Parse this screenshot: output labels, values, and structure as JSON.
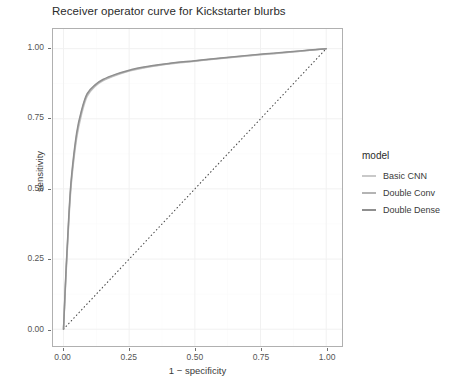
{
  "chart_data": {
    "type": "line",
    "title": "Receiver operator curve for Kickstarter blurbs",
    "xlabel": "1 − specificity",
    "ylabel": "sensitivity",
    "xlim": [
      -0.04,
      1.06
    ],
    "ylim": [
      -0.06,
      1.07
    ],
    "xticks": [
      "0.00",
      "0.25",
      "0.50",
      "0.75",
      "1.00"
    ],
    "xtick_values": [
      0.0,
      0.25,
      0.5,
      0.75,
      1.0
    ],
    "yticks": [
      "0.00",
      "0.25",
      "0.50",
      "0.75",
      "1.00"
    ],
    "ytick_values": [
      0.0,
      0.25,
      0.5,
      0.75,
      1.0
    ],
    "grid": true,
    "legend_position": "right",
    "legend_title": "model",
    "reference_line": {
      "name": "chance diagonal",
      "style": "dotted",
      "color": "#4d4d4d",
      "x": [
        0.0,
        1.0
      ],
      "y": [
        0.0,
        1.0
      ]
    },
    "series": [
      {
        "name": "Basic CNN",
        "color": "#c9c9c9",
        "x": [
          0.0,
          0.01,
          0.02,
          0.03,
          0.05,
          0.07,
          0.09,
          0.12,
          0.15,
          0.2,
          0.25,
          0.3,
          0.4,
          0.5,
          0.6,
          0.7,
          0.8,
          0.9,
          1.0
        ],
        "y": [
          0.0,
          0.2,
          0.38,
          0.52,
          0.68,
          0.77,
          0.83,
          0.865,
          0.885,
          0.905,
          0.92,
          0.93,
          0.945,
          0.955,
          0.965,
          0.974,
          0.982,
          0.991,
          1.0
        ]
      },
      {
        "name": "Double Conv",
        "color": "#b4b4b4",
        "x": [
          0.0,
          0.01,
          0.02,
          0.03,
          0.05,
          0.07,
          0.09,
          0.12,
          0.15,
          0.2,
          0.25,
          0.3,
          0.4,
          0.5,
          0.6,
          0.7,
          0.8,
          0.9,
          1.0
        ],
        "y": [
          0.0,
          0.21,
          0.39,
          0.53,
          0.69,
          0.78,
          0.835,
          0.868,
          0.888,
          0.907,
          0.921,
          0.932,
          0.946,
          0.956,
          0.966,
          0.975,
          0.983,
          0.991,
          1.0
        ]
      },
      {
        "name": "Double Dense",
        "color": "#8f8f8f",
        "x": [
          0.0,
          0.01,
          0.02,
          0.03,
          0.05,
          0.07,
          0.09,
          0.12,
          0.15,
          0.2,
          0.25,
          0.3,
          0.4,
          0.5,
          0.6,
          0.7,
          0.8,
          0.9,
          1.0
        ],
        "y": [
          0.0,
          0.22,
          0.4,
          0.54,
          0.7,
          0.785,
          0.84,
          0.871,
          0.89,
          0.909,
          0.923,
          0.934,
          0.947,
          0.957,
          0.967,
          0.976,
          0.984,
          0.992,
          1.0
        ]
      }
    ]
  },
  "legend": {
    "title": "model",
    "items": [
      {
        "label": "Basic CNN",
        "color": "#c9c9c9"
      },
      {
        "label": "Double Conv",
        "color": "#b4b4b4"
      },
      {
        "label": "Double Dense",
        "color": "#8f8f8f"
      }
    ]
  },
  "axes": {
    "x_label": "1 − specificity",
    "y_label": "sensitivity"
  },
  "colors": {
    "panel_border": "#b0b0b0",
    "gridline": "#f2f2f2",
    "tick_text": "#555555",
    "title_text": "#2b2b2b"
  }
}
